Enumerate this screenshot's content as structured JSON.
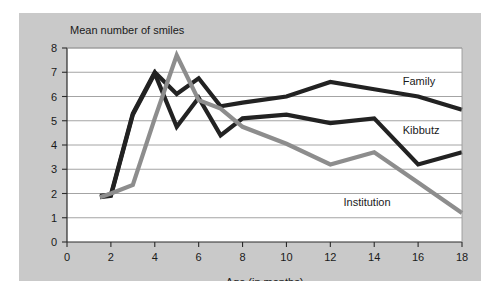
{
  "figure": {
    "background_color": "#ffffff",
    "panel_color": "#c9c9c9",
    "plot_color": "#ffffff"
  },
  "chart_data": {
    "type": "line",
    "title": "",
    "subtitle": "",
    "xlabel": "Age (in months)",
    "ylabel": "Mean number of smiles",
    "xlim": [
      0,
      18
    ],
    "ylim": [
      0,
      8
    ],
    "xticks": [
      0,
      2,
      4,
      6,
      8,
      10,
      12,
      14,
      16,
      18
    ],
    "yticks": [
      0,
      1,
      2,
      3,
      4,
      5,
      6,
      7,
      8
    ],
    "xtick_labels": [
      "0",
      "2",
      "4",
      "6",
      "8",
      "10",
      "12",
      "14",
      "16",
      "18"
    ],
    "ytick_labels": [
      "0",
      "1",
      "2",
      "3",
      "4",
      "5",
      "6",
      "7",
      "8"
    ],
    "grid": "horizontal",
    "legend_position": "inline-right-labels",
    "series": [
      {
        "name": "Family",
        "color": "#222222",
        "width": 4.2,
        "label_x": 15.3,
        "label_y": 6.62,
        "x": [
          1.5,
          2,
          3,
          4,
          5,
          6,
          7,
          8,
          10,
          12,
          14,
          16,
          18
        ],
        "y": [
          1.9,
          1.95,
          5.3,
          7.0,
          6.1,
          6.75,
          5.6,
          5.75,
          6.0,
          6.6,
          6.3,
          6.0,
          5.45
        ]
      },
      {
        "name": "Kibbutz",
        "color": "#222222",
        "width": 4.2,
        "label_x": 15.3,
        "label_y": 4.6,
        "x": [
          1.5,
          2,
          3,
          4,
          5,
          6,
          7,
          8,
          10,
          12,
          14,
          16,
          18
        ],
        "y": [
          1.85,
          1.9,
          5.25,
          6.95,
          4.75,
          5.95,
          4.4,
          5.1,
          5.25,
          4.9,
          5.1,
          3.2,
          3.7
        ]
      },
      {
        "name": "Institution",
        "color": "#8d8d8d",
        "width": 4.2,
        "label_x": 12.6,
        "label_y": 1.65,
        "x": [
          1.5,
          2,
          3,
          4,
          5,
          6,
          7,
          8,
          10,
          12,
          14,
          16,
          18
        ],
        "y": [
          1.85,
          2.0,
          2.35,
          5.1,
          7.7,
          5.85,
          5.5,
          4.75,
          4.05,
          3.2,
          3.7,
          2.45,
          1.2
        ]
      }
    ],
    "annotations": [
      {
        "text": "Family",
        "x": 15.3,
        "y": 6.62
      },
      {
        "text": "Kibbutz",
        "x": 15.3,
        "y": 4.6
      },
      {
        "text": "Institution",
        "x": 12.6,
        "y": 1.65
      }
    ]
  }
}
